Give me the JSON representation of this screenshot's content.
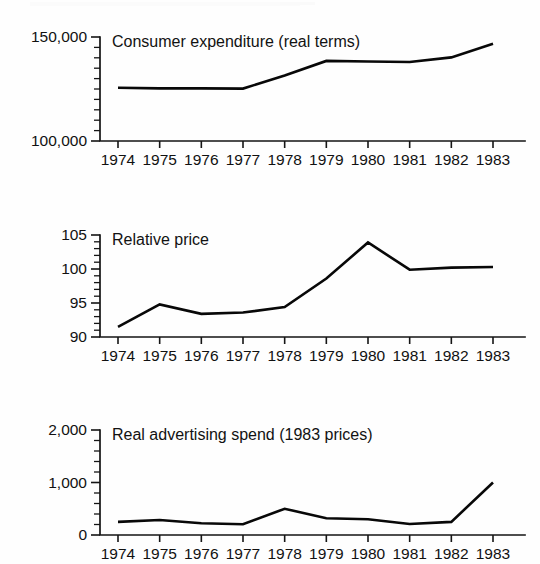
{
  "page": {
    "background_color": "#ffffff",
    "ink_color": "#111111",
    "document_kind": "scanned-figure"
  },
  "charts": [
    {
      "id": "consumer-expenditure",
      "title": "Consumer expenditure (real terms)",
      "type": "line",
      "xlabel": "",
      "ylabel": "",
      "categories": [
        "1974",
        "1975",
        "1976",
        "1977",
        "1978",
        "1979",
        "1980",
        "1981",
        "1982",
        "1983"
      ],
      "values": [
        125600,
        125300,
        125300,
        125200,
        131500,
        138500,
        138200,
        138000,
        140200,
        146800
      ],
      "ylim": [
        100000,
        150000
      ],
      "ytick_labels": [
        "150,000",
        "100,000"
      ],
      "ytick_values": [
        150000,
        100000
      ],
      "yminor_step": 5000,
      "grid": false,
      "legend": "none"
    },
    {
      "id": "relative-price",
      "title": "Relative price",
      "type": "line",
      "xlabel": "",
      "ylabel": "",
      "categories": [
        "1974",
        "1975",
        "1976",
        "1977",
        "1978",
        "1979",
        "1980",
        "1981",
        "1982",
        "1983"
      ],
      "values": [
        91.5,
        94.8,
        93.4,
        93.6,
        94.4,
        98.6,
        103.9,
        99.9,
        100.2,
        100.3
      ],
      "ylim": [
        90,
        105
      ],
      "ytick_labels": [
        "105",
        "100",
        "95",
        "90"
      ],
      "ytick_values": [
        105,
        100,
        95,
        90
      ],
      "yminor_step": 1,
      "grid": false,
      "legend": "none"
    },
    {
      "id": "advertising-spend",
      "title": "Real advertising spend (1983 prices)",
      "type": "line",
      "xlabel": "",
      "ylabel": "",
      "categories": [
        "1974",
        "1975",
        "1976",
        "1977",
        "1978",
        "1979",
        "1980",
        "1981",
        "1982",
        "1983"
      ],
      "values": [
        250,
        285,
        225,
        205,
        500,
        320,
        300,
        210,
        250,
        1000
      ],
      "ylim": [
        0,
        2000
      ],
      "ytick_labels": [
        "2,000",
        "1,000",
        "0"
      ],
      "ytick_values": [
        2000,
        1000,
        0
      ],
      "yminor_step": 200,
      "grid": false,
      "legend": "none"
    }
  ],
  "chart_data": [
    {
      "type": "line",
      "title": "Consumer expenditure (real terms)",
      "xlabel": "",
      "ylabel": "",
      "categories": [
        "1974",
        "1975",
        "1976",
        "1977",
        "1978",
        "1979",
        "1980",
        "1981",
        "1982",
        "1983"
      ],
      "values": [
        125600,
        125300,
        125300,
        125200,
        131500,
        138500,
        138200,
        138000,
        140200,
        146800
      ],
      "ylim": [
        100000,
        150000
      ],
      "yticks": [
        100000,
        150000
      ],
      "ytick_labels": [
        "100,000",
        "150,000"
      ],
      "grid": false,
      "legend_position": "none"
    },
    {
      "type": "line",
      "title": "Relative price",
      "xlabel": "",
      "ylabel": "",
      "categories": [
        "1974",
        "1975",
        "1976",
        "1977",
        "1978",
        "1979",
        "1980",
        "1981",
        "1982",
        "1983"
      ],
      "values": [
        91.5,
        94.8,
        93.4,
        93.6,
        94.4,
        98.6,
        103.9,
        99.9,
        100.2,
        100.3
      ],
      "ylim": [
        90,
        105
      ],
      "yticks": [
        90,
        95,
        100,
        105
      ],
      "ytick_labels": [
        "90",
        "95",
        "100",
        "105"
      ],
      "grid": false,
      "legend_position": "none"
    },
    {
      "type": "line",
      "title": "Real advertising spend (1983 prices)",
      "xlabel": "",
      "ylabel": "",
      "categories": [
        "1974",
        "1975",
        "1976",
        "1977",
        "1978",
        "1979",
        "1980",
        "1981",
        "1982",
        "1983"
      ],
      "values": [
        250,
        285,
        225,
        205,
        500,
        320,
        300,
        210,
        250,
        1000
      ],
      "ylim": [
        0,
        2000
      ],
      "yticks": [
        0,
        1000,
        2000
      ],
      "ytick_labels": [
        "0",
        "1,000",
        "2,000"
      ],
      "grid": false,
      "legend_position": "none"
    }
  ]
}
